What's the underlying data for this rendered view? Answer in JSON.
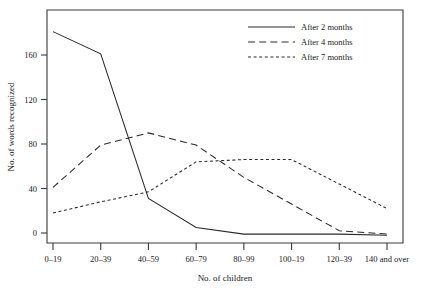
{
  "chart_data": {
    "type": "line",
    "title": "",
    "xlabel": "No. of children",
    "ylabel": "No. of words recognized",
    "categories": [
      "0–19",
      "20–39",
      "40–59",
      "60–79",
      "80–99",
      "100–19",
      "120–39",
      "140 and over"
    ],
    "ytick_labels": [
      "0",
      "40",
      "80",
      "120",
      "160"
    ],
    "ytick_values": [
      0,
      40,
      80,
      120,
      160
    ],
    "ylim": [
      -6,
      192
    ],
    "xlim": [
      0,
      7
    ],
    "grid": false,
    "legend_position": "top-right",
    "frame": "box",
    "series": [
      {
        "name": "After 2 months",
        "style": "solid",
        "values": [
          181,
          161,
          31,
          5,
          -1,
          -1,
          -1,
          -2
        ]
      },
      {
        "name": "After 4 months",
        "style": "long-dash",
        "values": [
          41,
          79,
          90,
          79,
          50,
          26,
          2,
          -1
        ]
      },
      {
        "name": "After 7 months",
        "style": "short-dash",
        "values": [
          18,
          28,
          37,
          64,
          66,
          66,
          44,
          22
        ]
      }
    ]
  },
  "legend": {
    "entries": [
      {
        "label": "After 2 months",
        "style": "solid"
      },
      {
        "label": "After 4 months",
        "style": "long-dash"
      },
      {
        "label": "After 7 months",
        "style": "short-dash"
      }
    ]
  },
  "axes": {
    "x_title": "No. of children",
    "y_title": "No. of words recognized",
    "x_labels": [
      "0–19",
      "20–39",
      "40–59",
      "60–79",
      "80–99",
      "100–19",
      "120–39",
      "140 and over"
    ],
    "y_labels": [
      "0",
      "40",
      "80",
      "120",
      "160"
    ]
  },
  "colors": {
    "ink": "#2b2b2b",
    "background": "#ffffff"
  }
}
